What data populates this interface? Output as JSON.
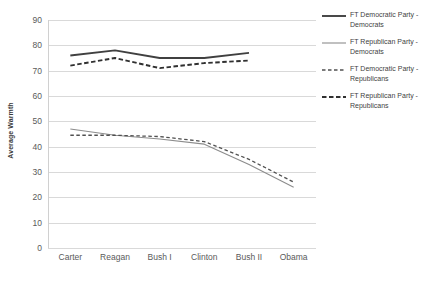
{
  "chart_data": {
    "type": "line",
    "title": "",
    "xlabel": "",
    "ylabel": "Average Warmth",
    "ylim": [
      0,
      90
    ],
    "ytick_step": 10,
    "yticks": [
      90,
      80,
      70,
      60,
      50,
      40,
      30,
      20,
      10,
      0
    ],
    "grid": true,
    "legend_position": "right",
    "categories": [
      "Carter",
      "Reagan",
      "Bush I",
      "Clinton",
      "Bush II",
      "Obama"
    ],
    "series": [
      {
        "name": "FT Democratic Party - Democrats",
        "label_line1": "FT Democratic Party -",
        "label_line2": "Democrats",
        "style": "solid",
        "color": "#404040",
        "width": 1.9,
        "values": [
          76,
          78,
          75,
          75,
          77,
          null
        ]
      },
      {
        "name": "FT Republican Party - Democrats",
        "label_line1": "FT Republican Party -",
        "label_line2": "Democrats",
        "style": "solid",
        "color": "#8c8c8c",
        "width": 1.1,
        "values": [
          47,
          44.5,
          43,
          41,
          33,
          24
        ]
      },
      {
        "name": "FT Democratic Party - Republicans",
        "label_line1": "FT Democratic Party -",
        "label_line2": "Republicans",
        "style": "dashed",
        "color": "#505050",
        "width": 1.3,
        "values": [
          44.5,
          44.5,
          44,
          42,
          35,
          26
        ]
      },
      {
        "name": "FT Republican Party - Republicans",
        "label_line1": "FT Republican Party -",
        "label_line2": "Republicans",
        "style": "dashed",
        "color": "#303030",
        "width": 1.9,
        "values": [
          72,
          75,
          71,
          73,
          74,
          null
        ]
      }
    ]
  },
  "legend": {
    "entries": [
      {
        "label": "FT Democratic Party -\nDemocrats"
      },
      {
        "label": "FT Republican Party -\nDemocrats"
      },
      {
        "label": "FT Democratic Party -\nRepublicans"
      },
      {
        "label": "FT Republican Party -\nRepublicans"
      }
    ]
  },
  "axes": {
    "y_title": "Average Warmth"
  }
}
